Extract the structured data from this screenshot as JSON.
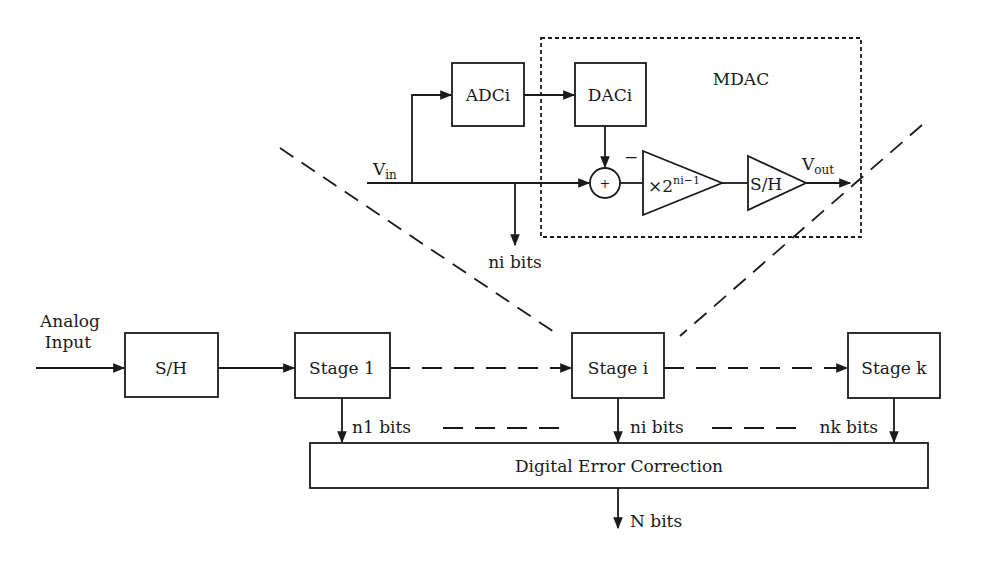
{
  "diagram": {
    "mdac": {
      "label": "MDAC",
      "adc_label": "ADCi",
      "dac_label": "DACi",
      "vin_label": "V",
      "vin_sub": "in",
      "vout_label": "V",
      "vout_sub": "out",
      "sum_plus": "+",
      "sum_minus": "−",
      "gain_prefix": "×2",
      "gain_exp": "ni−1",
      "sh_label": "S/H",
      "bits_label": "ni bits"
    },
    "pipeline": {
      "input_label_line1": "Analog",
      "input_label_line2": "Input",
      "sh_label": "S/H",
      "stages": [
        {
          "label": "Stage 1",
          "bits": "n1 bits"
        },
        {
          "label": "Stage i",
          "bits": "ni bits"
        },
        {
          "label": "Stage k",
          "bits": "nk bits"
        }
      ],
      "correction_label": "Digital Error Correction",
      "output_label": "N bits"
    },
    "colors": {
      "line": "#1a1a1a",
      "background": "#ffffff"
    }
  }
}
